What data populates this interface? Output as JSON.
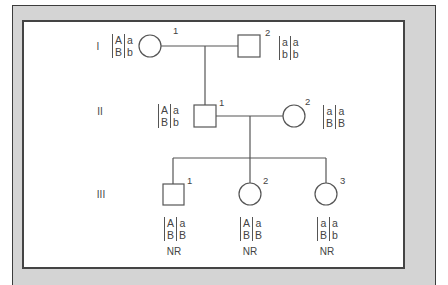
{
  "diagram": {
    "type": "pedigree",
    "colors": {
      "line": "#555555",
      "frame_border": "#3c3c3c",
      "frame_fill": "#d4d4d4",
      "background": "#ffffff"
    },
    "generations": [
      {
        "label": "I"
      },
      {
        "label": "II"
      },
      {
        "label": "III"
      }
    ],
    "individuals": {
      "I1": {
        "id": "1",
        "sex": "female",
        "genotype": {
          "hap1": [
            "A",
            "B"
          ],
          "hap2": [
            "a",
            "b"
          ]
        }
      },
      "I2": {
        "id": "2",
        "sex": "male",
        "genotype": {
          "hap1": [
            "a",
            "b"
          ],
          "hap2": [
            "a",
            "b"
          ]
        }
      },
      "II1": {
        "id": "1",
        "sex": "male",
        "genotype": {
          "hap1": [
            "A",
            "B"
          ],
          "hap2": [
            "a",
            "b"
          ]
        }
      },
      "II2": {
        "id": "2",
        "sex": "female",
        "genotype": {
          "hap1": [
            "a",
            "B"
          ],
          "hap2": [
            "a",
            "B"
          ]
        }
      },
      "III1": {
        "id": "1",
        "sex": "male",
        "genotype": {
          "hap1": [
            "A",
            "B"
          ],
          "hap2": [
            "a",
            "B"
          ]
        },
        "status": "NR"
      },
      "III2": {
        "id": "2",
        "sex": "female",
        "genotype": {
          "hap1": [
            "A",
            "B"
          ],
          "hap2": [
            "a",
            "B"
          ]
        },
        "status": "NR"
      },
      "III3": {
        "id": "3",
        "sex": "female",
        "genotype": {
          "hap1": [
            "a",
            "B"
          ],
          "hap2": [
            "a",
            "b"
          ]
        },
        "status": "NR"
      }
    }
  }
}
